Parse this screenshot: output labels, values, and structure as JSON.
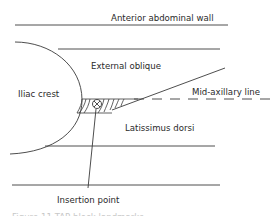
{
  "diagram": {
    "labels": {
      "anterior_abdominal_wall": "Anterior abdominal wall",
      "external_oblique": "External oblique",
      "iliac_crest": "Iliac crest",
      "mid_axillary_line": "Mid-axillary line",
      "latissimus_dorsi": "Latissimus dorsi",
      "insertion_point": "Insertion point"
    },
    "caption": "Figure 11 TAP block landmarks"
  }
}
